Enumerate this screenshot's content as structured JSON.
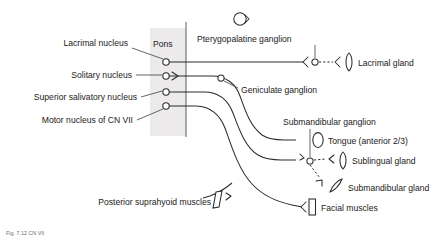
{
  "figure": {
    "caption": "Fig. 7.12  CN VII",
    "region_label": "Pons"
  },
  "nuclei": [
    {
      "id": "lacrimal-nucleus",
      "label": "Lacrimal nucleus"
    },
    {
      "id": "solitary-nucleus",
      "label": "Solitary nucleus"
    },
    {
      "id": "superior-salivatory-nucleus",
      "label": "Superior salivatory nucleus"
    },
    {
      "id": "motor-nucleus-cn-vii",
      "label": "Motor nucleus of CN VII"
    }
  ],
  "ganglia": [
    {
      "id": "pterygopalatine-ganglion",
      "label": "Pterygopalatine ganglion"
    },
    {
      "id": "geniculate-ganglion",
      "label": "Geniculate ganglion"
    },
    {
      "id": "submandibular-ganglion",
      "label": "Submandibular ganglion"
    }
  ],
  "targets": [
    {
      "id": "lacrimal-gland",
      "label": "Lacrimal gland"
    },
    {
      "id": "tongue-anterior",
      "label": "Tongue (anterior 2/3)"
    },
    {
      "id": "sublingual-gland",
      "label": "Sublingual gland"
    },
    {
      "id": "submandibular-gland",
      "label": "Submandibular gland"
    },
    {
      "id": "posterior-suprahyoid-muscles",
      "label": "Posterior suprahyoid muscles"
    },
    {
      "id": "facial-muscles",
      "label": "Facial muscles"
    }
  ],
  "colors": {
    "nerve": "#2b2b2b",
    "text": "#1a1a1a",
    "leader": "#4a4a4a",
    "pons_fill": "#eceaea",
    "background": "#ffffff",
    "caption": "#6e6e6e"
  }
}
